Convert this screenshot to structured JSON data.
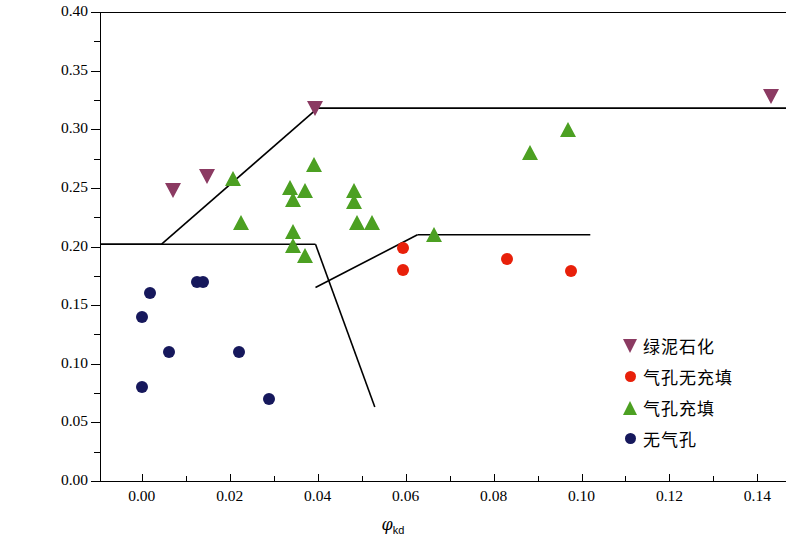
{
  "chart_data": {
    "type": "scatter",
    "title": "",
    "xlabel": "φkd",
    "ylabel": "CNL(体积比)",
    "xlim": [
      -0.0095,
      0.1465
    ],
    "ylim": [
      0.0,
      0.4
    ],
    "xticks": [
      "0.00",
      "0.02",
      "0.04",
      "0.06",
      "0.08",
      "0.10",
      "0.12",
      "0.14"
    ],
    "xtick_values": [
      0.0,
      0.02,
      0.04,
      0.06,
      0.08,
      0.1,
      0.12,
      0.14
    ],
    "yticks": [
      "0.00",
      "0.05",
      "0.10",
      "0.15",
      "0.20",
      "0.25",
      "0.30",
      "0.35",
      "0.40"
    ],
    "ytick_values": [
      0.0,
      0.05,
      0.1,
      0.15,
      0.2,
      0.25,
      0.3,
      0.35,
      0.4
    ],
    "grid": false,
    "legend_position": "right-lower",
    "series": [
      {
        "name": "绿泥石化",
        "marker": "triangle-down",
        "color": "#8B3A62",
        "points": [
          {
            "x": 0.007,
            "y": 0.248
          },
          {
            "x": 0.0148,
            "y": 0.26
          },
          {
            "x": 0.0395,
            "y": 0.318
          },
          {
            "x": 0.1432,
            "y": 0.328
          }
        ]
      },
      {
        "name": "气孔无充填",
        "marker": "circle",
        "color": "#E8200A",
        "points": [
          {
            "x": 0.0595,
            "y": 0.199
          },
          {
            "x": 0.0595,
            "y": 0.18
          },
          {
            "x": 0.083,
            "y": 0.189
          },
          {
            "x": 0.0975,
            "y": 0.179
          }
        ]
      },
      {
        "name": "气孔充填",
        "marker": "triangle-up",
        "color": "#4CA022",
        "points": [
          {
            "x": 0.0208,
            "y": 0.258
          },
          {
            "x": 0.0225,
            "y": 0.22
          },
          {
            "x": 0.0338,
            "y": 0.25
          },
          {
            "x": 0.0372,
            "y": 0.248
          },
          {
            "x": 0.0345,
            "y": 0.24
          },
          {
            "x": 0.0392,
            "y": 0.27
          },
          {
            "x": 0.0343,
            "y": 0.213
          },
          {
            "x": 0.0343,
            "y": 0.201
          },
          {
            "x": 0.0372,
            "y": 0.192
          },
          {
            "x": 0.0482,
            "y": 0.248
          },
          {
            "x": 0.0482,
            "y": 0.238
          },
          {
            "x": 0.049,
            "y": 0.22
          },
          {
            "x": 0.0523,
            "y": 0.22
          },
          {
            "x": 0.0665,
            "y": 0.21
          },
          {
            "x": 0.0882,
            "y": 0.28
          },
          {
            "x": 0.097,
            "y": 0.3
          }
        ]
      },
      {
        "name": "无气孔",
        "marker": "circle",
        "color": "#16185C",
        "points": [
          {
            "x": 0.0018,
            "y": 0.16
          },
          {
            "x": 0.0,
            "y": 0.14
          },
          {
            "x": 0.0125,
            "y": 0.17
          },
          {
            "x": 0.014,
            "y": 0.17
          },
          {
            "x": 0.0063,
            "y": 0.11
          },
          {
            "x": 0.0,
            "y": 0.08
          },
          {
            "x": 0.0222,
            "y": 0.11
          },
          {
            "x": 0.029,
            "y": 0.07
          }
        ]
      }
    ],
    "boundaries": [
      {
        "name": "upper-left-plateau",
        "points": [
          [
            -0.0095,
            0.202
          ],
          [
            0.0045,
            0.202
          ]
        ]
      },
      {
        "name": "upper-diagonal",
        "points": [
          [
            0.0045,
            0.202
          ],
          [
            0.04,
            0.318
          ]
        ]
      },
      {
        "name": "upper-right-plateau",
        "points": [
          [
            0.04,
            0.318
          ],
          [
            0.1465,
            0.318
          ]
        ]
      },
      {
        "name": "mid-left-plateau",
        "points": [
          [
            -0.0095,
            0.202
          ],
          [
            0.0395,
            0.202
          ]
        ]
      },
      {
        "name": "mid-descending",
        "points": [
          [
            0.0395,
            0.202
          ],
          [
            0.053,
            0.063
          ]
        ]
      },
      {
        "name": "mid-ascending",
        "points": [
          [
            0.0395,
            0.165
          ],
          [
            0.0627,
            0.21
          ]
        ]
      },
      {
        "name": "mid-right-plateau",
        "points": [
          [
            0.0627,
            0.21
          ],
          [
            0.102,
            0.21
          ]
        ]
      }
    ]
  }
}
